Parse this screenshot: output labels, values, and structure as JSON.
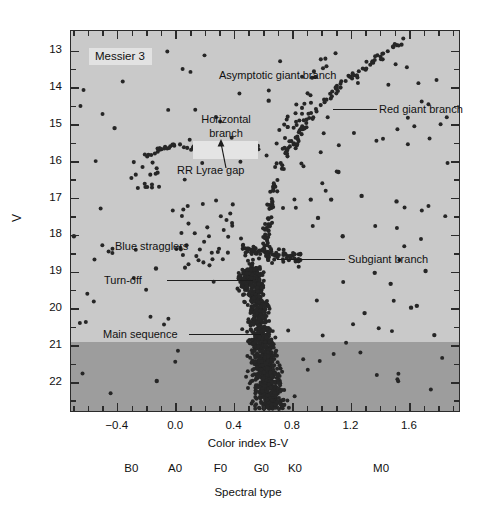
{
  "figure": {
    "cluster_label": "Messier 3"
  },
  "axes": {
    "y_title": "V",
    "x_title": "Color index B-V",
    "spectral_title": "Spectral type",
    "y_ticks": [
      "13",
      "14",
      "15",
      "16",
      "17",
      "18",
      "19",
      "20",
      "21",
      "22"
    ],
    "x_ticks": [
      "−0.4",
      "0.0",
      "0.4",
      "0.8",
      "1.2",
      "1.6"
    ],
    "spectral_ticks": [
      "B0",
      "A0",
      "F0",
      "G0",
      "K0",
      "M0"
    ]
  },
  "annotations": [
    {
      "name": "asymptotic-giant-branch",
      "label": "Asymptotic giant branch"
    },
    {
      "name": "red-giant-branch",
      "label": "Red giant branch"
    },
    {
      "name": "horizontal-branch",
      "label": "Horizontal\nbranch"
    },
    {
      "name": "rr-lyrae-gap",
      "label": "RR Lyrae gap"
    },
    {
      "name": "blue-stragglers",
      "label": "Blue stragglers"
    },
    {
      "name": "turn-off",
      "label": "Turn-off"
    },
    {
      "name": "subgiant-branch",
      "label": "Subgiant branch"
    },
    {
      "name": "main-sequence",
      "label": "Main sequence"
    }
  ],
  "anno_text": {
    "agb": "Asymptotic giant branch",
    "rgb": "Red giant branch",
    "hb_line1": "Horizontal",
    "hb_line2": "branch",
    "rrlyrae": "RR Lyrae gap",
    "blue_stragglers": "Blue stragglers",
    "turnoff": "Turn-off",
    "sgb": "Subgiant branch",
    "ms": "Main sequence"
  },
  "colors": {
    "plot_background": "#c9c9c9",
    "faint_band": "#9d9d9d",
    "frame": "#2b2b2b",
    "star": "#262626",
    "label_box": "#e2e2e2"
  },
  "chart_data": {
    "type": "scatter",
    "xlabel": "Color index B-V",
    "ylabel": "V",
    "xlim": [
      -0.72,
      1.95
    ],
    "ylim": [
      22.82,
      12.45
    ],
    "y_inverted": true,
    "grid": false,
    "legend": "none",
    "x_ticks": [
      -0.4,
      0.0,
      0.4,
      0.8,
      1.2,
      1.6
    ],
    "x_minor_step": 0.1,
    "y_ticks": [
      13,
      14,
      15,
      16,
      17,
      18,
      19,
      20,
      21,
      22
    ],
    "y_minor_step": 0.5,
    "secondary_x_axis": {
      "label": "Spectral type",
      "ticks": [
        "B0",
        "A0",
        "F0",
        "G0",
        "K0",
        "M0"
      ],
      "bv_positions": [
        -0.3,
        0.0,
        0.31,
        0.59,
        0.82,
        1.41
      ]
    },
    "shaded_region": {
      "description": "darker band marking photometric incompleteness",
      "y_from": 21.0,
      "y_to": 22.82
    },
    "series": [
      {
        "name": "Red giant branch",
        "n_points": 150,
        "description": "steep sequence rising from V~18.6 at B-V~0.62 to V~12.7 at B-V~1.55"
      },
      {
        "name": "Asymptotic giant branch",
        "n_points": 20,
        "description": "sparse bluer parallel sequence, V 13.0-15.5, B-V 0.75-1.10"
      },
      {
        "name": "Horizontal branch",
        "n_points": 55,
        "description": "near-horizontal strip at V~15.6, B-V from -0.25 to 0.55"
      },
      {
        "name": "RR Lyrae gap",
        "n_points": 0,
        "description": "empty instability strip in horizontal branch, B-V 0.18-0.40 at V~15.6"
      },
      {
        "name": "Subgiant branch",
        "n_points": 70,
        "description": "flat bridge at V~18.4-18.8, B-V 0.48-0.82"
      },
      {
        "name": "Main sequence",
        "n_points": 900,
        "description": "dense near-vertical ridge at B-V~0.52-0.70 from V~18.8 down to V~22.8"
      },
      {
        "name": "Blue stragglers",
        "n_points": 25,
        "description": "scattered points blueward of turn-off, V 17.0-18.9, B-V -0.05-0.35"
      },
      {
        "name": "Turn-off",
        "n_points": 1,
        "description": "main-sequence turn-off point near V 18.9, B-V 0.45"
      },
      {
        "name": "Field contamination",
        "n_points": 120,
        "description": "sparse scatter across full colour range"
      }
    ],
    "total_points": 1341
  }
}
